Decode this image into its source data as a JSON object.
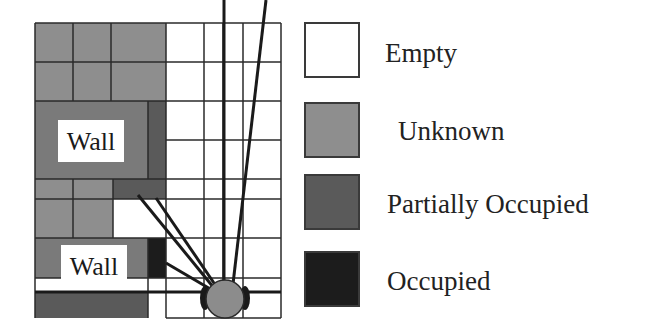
{
  "diagram": {
    "type": "occupancy-grid-map",
    "wall_labels": [
      "Wall",
      "Wall"
    ],
    "robot": {
      "shape": "circle",
      "color": "#8c8c8c"
    }
  },
  "legend": {
    "items": [
      {
        "label": "Empty",
        "color": "#ffffff"
      },
      {
        "label": "Unknown",
        "color": "#8e8e8e"
      },
      {
        "label": "Partially Occupied",
        "color": "#5a5a5a"
      },
      {
        "label": "Occupied",
        "color": "#1c1c1c"
      }
    ]
  },
  "colors": {
    "empty": "#ffffff",
    "unknown": "#8e8e8e",
    "partial": "#5a5a5a",
    "occupied": "#1c1c1c",
    "grid_line": "#2a2a2a"
  }
}
